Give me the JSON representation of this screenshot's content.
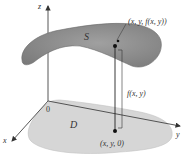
{
  "diagram": {
    "type": "3d-surface-over-region",
    "labels": {
      "z_axis": "z",
      "x_axis": "x",
      "y_axis": "y",
      "origin": "0",
      "surface": "S",
      "region": "D",
      "surface_point": "(x, y, f(x, y))",
      "base_point": "(x, y, 0)",
      "height": "f(x, y)"
    },
    "colors": {
      "surface": "#8a8a8a",
      "surface_highlight": "#a8a8a8",
      "region": "#d4d4d4",
      "axes": "#444444",
      "text": "#333333",
      "background": "#ffffff"
    }
  }
}
